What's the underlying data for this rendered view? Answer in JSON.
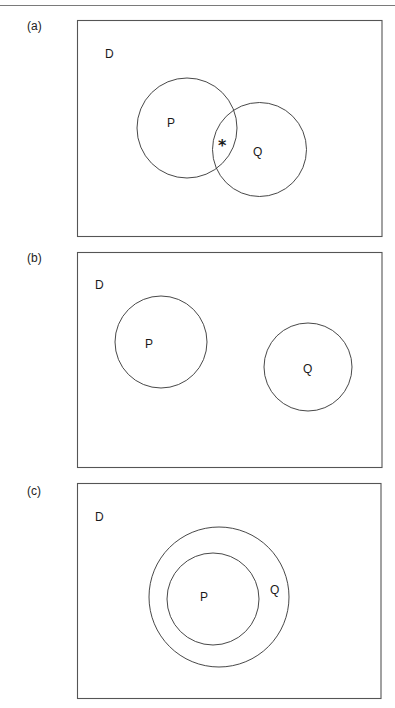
{
  "figure": {
    "panels": [
      {
        "id": "a",
        "label": "(a)",
        "universe_label": "D",
        "sets": [
          {
            "name": "P",
            "label": "P",
            "cx": 187,
            "cy": 128,
            "r": 50,
            "label_x": 172,
            "label_y": 127
          },
          {
            "name": "Q",
            "label": "Q",
            "cx": 259.5,
            "cy": 149.5,
            "r": 47,
            "label_x": 255,
            "label_y": 156
          }
        ],
        "intersection_marker": "*",
        "relationship": "overlapping"
      },
      {
        "id": "b",
        "label": "(b)",
        "universe_label": "D",
        "sets": [
          {
            "name": "P",
            "label": "P",
            "cx": 161,
            "cy": 342,
            "r": 46,
            "label_x": 145,
            "label_y": 348
          },
          {
            "name": "Q",
            "label": "Q",
            "cx": 308,
            "cy": 367,
            "r": 44,
            "label_x": 303,
            "label_y": 373
          }
        ],
        "relationship": "disjoint"
      },
      {
        "id": "c",
        "label": "(c)",
        "universe_label": "D",
        "sets": [
          {
            "name": "Q",
            "label": "Q",
            "cx": 219,
            "cy": 597,
            "r": 70,
            "label_x": 270,
            "label_y": 593
          },
          {
            "name": "P",
            "label": "P",
            "cx": 213,
            "cy": 599,
            "r": 46,
            "label_x": 200,
            "label_y": 600
          }
        ],
        "relationship": "P subset of Q"
      }
    ]
  }
}
